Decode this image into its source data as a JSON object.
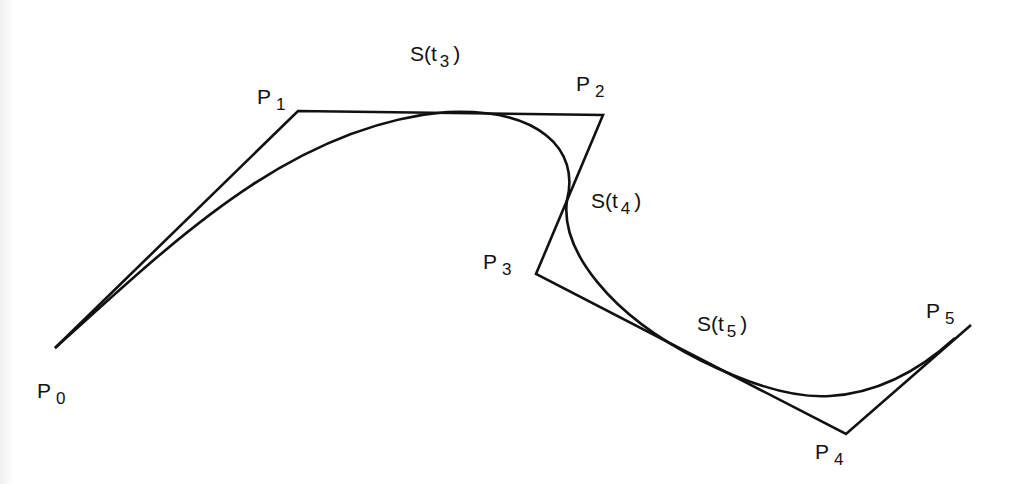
{
  "diagram": {
    "type": "B-spline curve with control polygon",
    "colors": {
      "stroke": "#111111",
      "background": "#ffffff"
    },
    "control_points": [
      {
        "name": "P",
        "sub": "0",
        "x": 55,
        "y": 348
      },
      {
        "name": "P",
        "sub": "1",
        "x": 298,
        "y": 111
      },
      {
        "name": "P",
        "sub": "2",
        "x": 603,
        "y": 115
      },
      {
        "name": "P",
        "sub": "3",
        "x": 536,
        "y": 274
      },
      {
        "name": "P",
        "sub": "4",
        "x": 846,
        "y": 434
      },
      {
        "name": "P",
        "sub": "5",
        "x": 971,
        "y": 325
      }
    ],
    "curve_points": [
      {
        "name": "S(t",
        "sub": "3",
        "close": ")"
      },
      {
        "name": "S(t",
        "sub": "4",
        "close": ")"
      },
      {
        "name": "S(t",
        "sub": "5",
        "close": ")"
      }
    ]
  }
}
